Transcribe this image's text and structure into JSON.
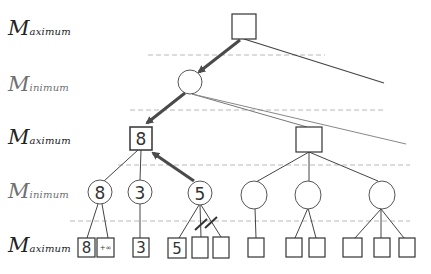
{
  "diagram": {
    "levels": [
      {
        "cap": "M",
        "rest": "aximum",
        "type": "max",
        "y": 18
      },
      {
        "cap": "M",
        "rest": "inimum",
        "type": "min",
        "y": 74
      },
      {
        "cap": "M",
        "rest": "aximum",
        "type": "max",
        "y": 127
      },
      {
        "cap": "M",
        "rest": "inimum",
        "type": "min",
        "y": 181
      },
      {
        "cap": "M",
        "rest": "aximum",
        "type": "max",
        "y": 235
      }
    ],
    "nodes": {
      "max_left_value": "8",
      "min_values": [
        "8",
        "3",
        "5",
        "",
        "",
        ""
      ],
      "leaf_values": [
        "8",
        "+∞",
        "3",
        "5",
        "",
        "",
        "",
        "",
        "",
        "",
        "",
        ""
      ]
    },
    "colors": {
      "line": "#333333",
      "thin_line": "#555555",
      "faint_line": "#8a8a8a",
      "dashed": "#b0b0b0",
      "arrow": "#4a4a4a"
    }
  }
}
